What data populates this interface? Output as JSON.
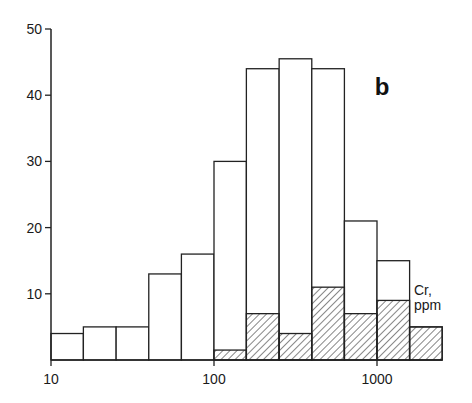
{
  "chart_data": {
    "type": "bar",
    "subtype": "histogram",
    "panel_label": "b",
    "xlabel": "Cr, ppm",
    "xlabel_lines": [
      "Cr,",
      "ppm"
    ],
    "ylabel": "",
    "xscale": "log",
    "xlim": [
      10,
      2512
    ],
    "ylim": [
      0,
      50
    ],
    "x_ticks": [
      10,
      100,
      1000
    ],
    "x_tick_labels": [
      "10",
      "100",
      "1000"
    ],
    "y_ticks": [
      10,
      20,
      30,
      40,
      50
    ],
    "y_tick_labels": [
      "10",
      "20",
      "30",
      "40",
      "50"
    ],
    "bin_edges": [
      10,
      15.8,
      25.1,
      39.8,
      63.1,
      100,
      158,
      251,
      398,
      631,
      1000,
      1585,
      2512
    ],
    "series": [
      {
        "name": "total",
        "style": "open",
        "values": [
          4,
          5,
          5,
          13,
          16,
          30,
          44,
          45.5,
          44,
          21,
          15,
          5
        ]
      },
      {
        "name": "subset",
        "style": "hatched",
        "values": [
          0,
          0,
          0,
          0,
          0,
          1.5,
          7,
          4,
          11,
          7,
          9,
          5
        ]
      }
    ],
    "grid": false,
    "legend": null
  }
}
